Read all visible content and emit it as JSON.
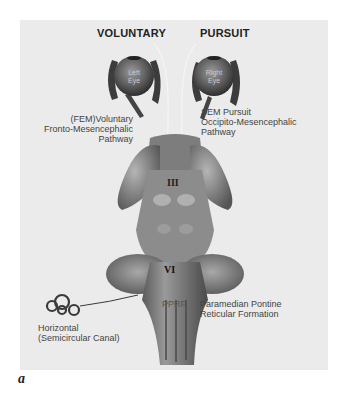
{
  "headings": {
    "voluntary": "VOLUNTARY",
    "pursuit": "PURSUIT"
  },
  "eyes": {
    "left": {
      "line1": "Left",
      "line2": "Eye"
    },
    "right": {
      "line1": "Right",
      "line2": "Eye"
    }
  },
  "labels": {
    "fem": {
      "line1": "(FEM)Voluntary",
      "line2": "Fronto-Mesencephalic",
      "line3": "Pathway"
    },
    "sem": {
      "line1": "SEM Pursuit",
      "line2": "Occipito-Mesencephalic",
      "line3": "Pathway"
    },
    "nerve_iii": "III",
    "nerve_vi": "VI",
    "pprf_abbrev": "PPRF",
    "pprf": {
      "line1": "Paramedian Pontine",
      "line2": "Reticular Formation"
    },
    "canal": {
      "line1": "Horizontal",
      "line2": "(Semicircular Canal)"
    }
  },
  "figure_label": "a",
  "colors": {
    "panel": "#ebebeb",
    "brainstem": "#8a8a8a",
    "text": "#444444"
  }
}
